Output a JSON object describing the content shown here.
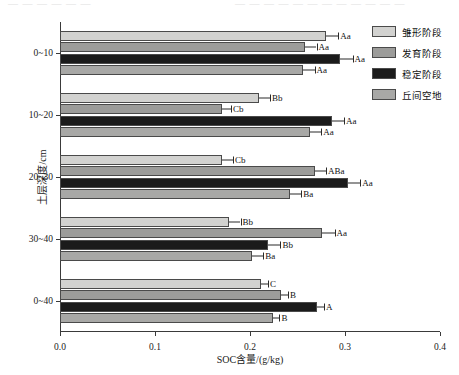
{
  "artifact_strip": "扫描残影",
  "chart_data": {
    "type": "bar",
    "orientation": "horizontal",
    "title": "",
    "xlabel": "SOC含量/(g/kg)",
    "ylabel": "土层深度/cm",
    "xlim": [
      0.0,
      0.4
    ],
    "xticks": [
      "0.0",
      "0.1",
      "0.2",
      "0.3",
      "0.4"
    ],
    "xtick_values": [
      0.0,
      0.1,
      0.2,
      0.3,
      0.4
    ],
    "grid": false,
    "legend_position": "right",
    "categories": [
      "0~10",
      "10~20",
      "20~30",
      "30~40",
      "0~40"
    ],
    "series": [
      {
        "name": "雏形阶段",
        "color": "#d2d2d0",
        "values": [
          0.28,
          0.209,
          0.17,
          0.178,
          0.212
        ],
        "errors": [
          0.013,
          0.012,
          0.012,
          0.012,
          0.007
        ],
        "letters": [
          "Aa",
          "Bb",
          "Cb",
          "Bb",
          "C"
        ]
      },
      {
        "name": "发育阶段",
        "color": "#9c9c9a",
        "values": [
          0.258,
          0.17,
          0.268,
          0.276,
          0.233
        ],
        "errors": [
          0.012,
          0.01,
          0.012,
          0.013,
          0.007
        ],
        "letters": [
          "Aa",
          "Cb",
          "ABa",
          "Aa",
          "B"
        ]
      },
      {
        "name": "稳定阶段",
        "color": "#1b1b1b",
        "values": [
          0.295,
          0.286,
          0.303,
          0.219,
          0.271
        ],
        "errors": [
          0.013,
          0.013,
          0.013,
          0.013,
          0.007
        ],
        "letters": [
          "Aa",
          "Aa",
          "Aa",
          "Bb",
          "A"
        ]
      },
      {
        "name": "丘间空地",
        "color": "#a8a8a6",
        "values": [
          0.256,
          0.263,
          0.242,
          0.202,
          0.224
        ],
        "errors": [
          0.012,
          0.012,
          0.012,
          0.012,
          0.007
        ],
        "letters": [
          "Aa",
          "Aa",
          "Ba",
          "Ba",
          "B"
        ]
      }
    ]
  },
  "legend": {
    "items": [
      {
        "label": "雏形阶段",
        "color": "#d2d2d0"
      },
      {
        "label": "发育阶段",
        "color": "#9c9c9a"
      },
      {
        "label": "稳定阶段",
        "color": "#1b1b1b"
      },
      {
        "label": "丘间空地",
        "color": "#a8a8a6"
      }
    ]
  }
}
